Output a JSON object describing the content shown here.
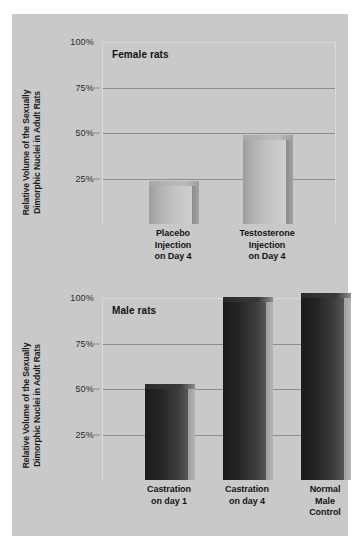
{
  "figure": {
    "background_color": "#c9c9c9",
    "page_background": "#ffffff"
  },
  "chart_data": [
    {
      "type": "bar",
      "title": "Female rats",
      "xlabel": "",
      "ylabel": "Relative Volume of the Sexually Dimorphic Nuclei in Adult Rats",
      "ylim": [
        0,
        100
      ],
      "yticks": [
        "100%",
        "75%",
        "50%",
        "25%"
      ],
      "ytick_values": [
        100,
        75,
        50,
        25
      ],
      "grid": true,
      "legend": "none",
      "categories": [
        "Placebo Injection on Day 4",
        "Testosterone Injection on Day 4"
      ],
      "category_lines": [
        [
          "Placebo",
          "Injection",
          "on Day 4"
        ],
        [
          "Testosterone",
          "Injection",
          "on Day 4"
        ]
      ],
      "values": [
        21,
        46
      ],
      "bar_color": "#b8b8b8"
    },
    {
      "type": "bar",
      "title": "Male rats",
      "xlabel": "",
      "ylabel": "Relative Volume of the Sexually Dimorphic Nuclei in Adult Rats",
      "ylim": [
        0,
        100
      ],
      "yticks": [
        "100%",
        "75%",
        "50%",
        "25%"
      ],
      "ytick_values": [
        100,
        75,
        50,
        25
      ],
      "grid": true,
      "legend": "none",
      "categories": [
        "Castration on day 1",
        "Castration on day 4",
        "Normal Male Control"
      ],
      "category_lines": [
        [
          "Castration",
          "on day 1"
        ],
        [
          "Castration",
          "on day 4"
        ],
        [
          "Normal",
          "Male",
          "Control"
        ]
      ],
      "values": [
        50,
        98,
        100
      ],
      "bar_color": "#262626"
    }
  ],
  "female": {
    "title": "Female rats",
    "axis_label_line1": "Relative Volume of the Sexually",
    "axis_label_line2": "Dimorphic Nuclei in Adult Rats",
    "ticks": [
      {
        "label": "100%",
        "value": 100
      },
      {
        "label": "75%",
        "value": 75
      },
      {
        "label": "50%",
        "value": 50
      },
      {
        "label": "25%",
        "value": 25
      }
    ],
    "bars": [
      {
        "value": 21,
        "l1": "Placebo",
        "l2": "Injection",
        "l3": "on Day 4"
      },
      {
        "value": 46,
        "l1": "Testosterone",
        "l2": "Injection",
        "l3": "on Day 4"
      }
    ]
  },
  "male": {
    "title": "Male rats",
    "axis_label_line1": "Relative Volume of the Sexually",
    "axis_label_line2": "Dimorphic Nuclei in Adult Rats",
    "ticks": [
      {
        "label": "100%",
        "value": 100
      },
      {
        "label": "75%",
        "value": 75
      },
      {
        "label": "50%",
        "value": 50
      },
      {
        "label": "25%",
        "value": 25
      }
    ],
    "bars": [
      {
        "value": 50,
        "l1": "Castration",
        "l2": "on day 1",
        "l3": ""
      },
      {
        "value": 98,
        "l1": "Castration",
        "l2": "on day 4",
        "l3": ""
      },
      {
        "value": 100,
        "l1": "Normal",
        "l2": "Male",
        "l3": "Control"
      }
    ]
  }
}
